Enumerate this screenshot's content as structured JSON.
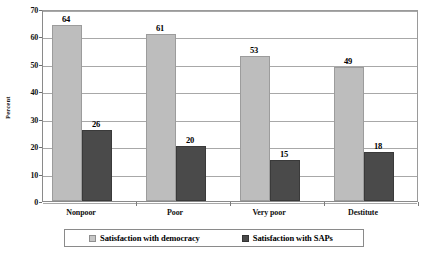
{
  "chart_data": {
    "type": "bar",
    "title": "",
    "xlabel": "",
    "ylabel": "Percent",
    "categories": [
      "Nonpoor",
      "Poor",
      "Very poor",
      "Destitute"
    ],
    "series": [
      {
        "name": "Satisfaction with democracy",
        "color": "#bdbdbd",
        "values": [
          64,
          61,
          53,
          49
        ]
      },
      {
        "name": "Satisfaction with SAPs",
        "color": "#4a4a4a",
        "values": [
          26,
          20,
          15,
          18
        ]
      }
    ],
    "ylim": [
      0,
      70
    ],
    "ytick_labels": [
      "0",
      "10",
      "20",
      "30",
      "40",
      "50",
      "60",
      "70"
    ],
    "ytick_values": [
      0,
      10,
      20,
      30,
      40,
      50,
      60,
      70
    ],
    "grid": true,
    "legend_position": "bottom",
    "value_labels": true
  },
  "legend": {
    "entries": [
      {
        "label": "Satisfaction with democracy",
        "swatch": "light-gray-swatch-icon"
      },
      {
        "label": "Satisfaction with SAPs",
        "swatch": "dark-gray-swatch-icon"
      }
    ]
  }
}
